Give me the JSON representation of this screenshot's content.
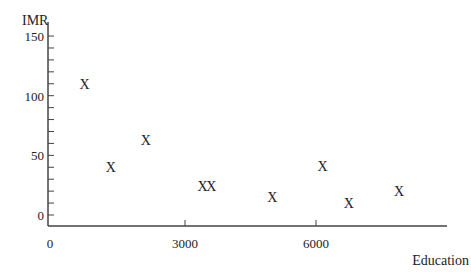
{
  "chart_data": {
    "type": "scatter",
    "title": "",
    "xlabel": "Education",
    "ylabel": "IMR",
    "marker": "X",
    "xlim": [
      0,
      8500
    ],
    "ylim": [
      -9,
      150
    ],
    "x_ticks": [
      0,
      3000,
      6000
    ],
    "x_tick_labels": [
      "0",
      "3000",
      "6000"
    ],
    "y_ticks": [
      0,
      50,
      100,
      150
    ],
    "y_tick_labels": [
      "0",
      "50",
      "100",
      "150"
    ],
    "y_minor_step": 10,
    "grid": false,
    "legend": null,
    "points": [
      {
        "x": 700,
        "y": 110
      },
      {
        "x": 1300,
        "y": 40
      },
      {
        "x": 2100,
        "y": 63
      },
      {
        "x": 3400,
        "y": 24
      },
      {
        "x": 3600,
        "y": 24
      },
      {
        "x": 5000,
        "y": 15
      },
      {
        "x": 6150,
        "y": 41
      },
      {
        "x": 6750,
        "y": 10
      },
      {
        "x": 7900,
        "y": 20
      }
    ]
  },
  "colors": {
    "axis": "#444444",
    "text": "#222222"
  }
}
